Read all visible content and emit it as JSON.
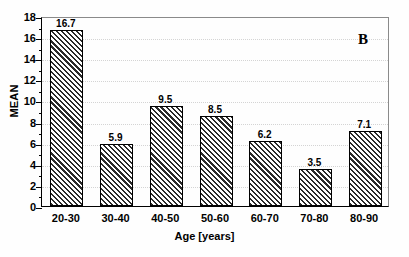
{
  "chart_data": {
    "type": "bar",
    "title": "",
    "panel_label": "B",
    "xlabel": "Age [years]",
    "ylabel": "MEAN",
    "categories": [
      "20-30",
      "30-40",
      "40-50",
      "50-60",
      "60-70",
      "70-80",
      "80-90"
    ],
    "values": [
      16.7,
      5.9,
      9.5,
      8.5,
      6.2,
      3.5,
      7.1
    ],
    "value_labels": [
      "16.7",
      "5.9",
      "9.5",
      "8.5",
      "6.2",
      "3.5",
      "7.1"
    ],
    "ylim": [
      0,
      18
    ],
    "ytick_labels": [
      "0",
      "2",
      "4",
      "6",
      "8",
      "10",
      "12",
      "14",
      "16",
      "18"
    ],
    "ytick_values": [
      0,
      2,
      4,
      6,
      8,
      10,
      12,
      14,
      16,
      18
    ],
    "ytick_step": 2,
    "yminor_step": 1,
    "grid": "horizontal-dotted",
    "legend": "none",
    "bar_fill": "diagonal-hatch",
    "bar_edge_color": "#000000",
    "grid_color": "#d4d4d4",
    "axis_color": "#000000",
    "background_color": "#ffffff"
  }
}
